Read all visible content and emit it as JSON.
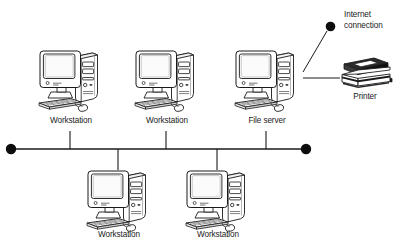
{
  "diagram": {
    "background_color": "#ffffff",
    "line_color": "#1a1a1a",
    "bus": {
      "name": "network-bus-line",
      "y": 149,
      "x_start": 11,
      "x_end": 306,
      "terminator_left": "bus-terminator-left",
      "terminator_right": "bus-terminator-right"
    },
    "nodes": [
      {
        "id": "workstation-1",
        "label": "Workstation",
        "icon": "desktop-computer-icon",
        "x": 70,
        "y": 48,
        "row": "top",
        "drop_line": true
      },
      {
        "id": "workstation-2",
        "label": "Workstation",
        "icon": "desktop-computer-icon",
        "x": 166,
        "y": 48,
        "row": "top",
        "drop_line": true
      },
      {
        "id": "file-server",
        "label": "File server",
        "icon": "desktop-computer-icon",
        "x": 266,
        "y": 48,
        "row": "top",
        "drop_line": true
      },
      {
        "id": "workstation-3",
        "label": "Workstation",
        "icon": "desktop-computer-icon",
        "x": 118,
        "y": 168,
        "row": "bottom",
        "drop_line": true
      },
      {
        "id": "workstation-4",
        "label": "Workstation",
        "icon": "desktop-computer-icon",
        "x": 217,
        "y": 168,
        "row": "bottom",
        "drop_line": true
      }
    ],
    "peripherals": [
      {
        "id": "printer",
        "label": "Printer",
        "icon": "printer-icon",
        "x": 360,
        "y": 75,
        "connected_to": "file-server",
        "link": "printer-link-line"
      }
    ],
    "external": [
      {
        "id": "internet-connection",
        "label_line_1": "Internet",
        "label_line_2": "connection",
        "icon": "connection-node-dot",
        "x": 331,
        "y": 27,
        "connected_to": "file-server",
        "link": "internet-link-line"
      }
    ]
  }
}
